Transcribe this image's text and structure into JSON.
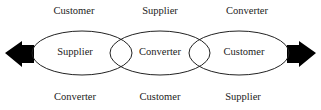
{
  "diagram": {
    "top_row": [
      "Customer",
      "Supplier",
      "Converter"
    ],
    "ellipses": [
      "Supplier",
      "Converter",
      "Customer"
    ],
    "bottom_row": [
      "Converter",
      "Customer",
      "Supplier"
    ],
    "arrows": {
      "left": "left-arrow",
      "right": "right-arrow"
    },
    "colors": {
      "stroke": "#222222",
      "arrow_fill": "#000000"
    }
  }
}
